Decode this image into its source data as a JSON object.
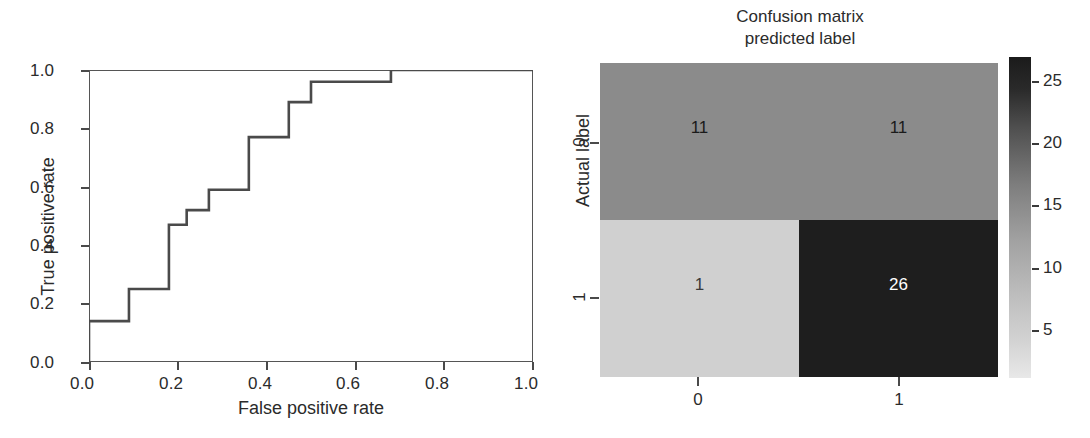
{
  "figure": {
    "background": "#ffffff",
    "width": 1090,
    "height": 438
  },
  "chart_data": [
    {
      "type": "line",
      "name": "roc-curve",
      "title": "",
      "xlabel": "False positive rate",
      "ylabel": "True positive rate",
      "xlim": [
        0.0,
        1.0
      ],
      "ylim": [
        0.0,
        1.0
      ],
      "xticks": [
        "0.0",
        "0.2",
        "0.4",
        "0.6",
        "0.8",
        "1.0"
      ],
      "xtick_values": [
        0.0,
        0.2,
        0.4,
        0.6,
        0.8,
        1.0
      ],
      "yticks": [
        "0.0",
        "0.2",
        "0.4",
        "0.6",
        "0.8",
        "1.0"
      ],
      "ytick_values": [
        0.0,
        0.2,
        0.4,
        0.6,
        0.8,
        1.0
      ],
      "grid": false,
      "legend": "none",
      "line_color": "#4a4a4a",
      "drawstyle": "steps-post",
      "x": [
        0.0,
        0.0,
        0.09,
        0.09,
        0.18,
        0.18,
        0.22,
        0.22,
        0.27,
        0.27,
        0.36,
        0.36,
        0.45,
        0.45,
        0.5,
        0.5,
        0.68,
        0.68,
        1.0
      ],
      "y": [
        0.0,
        0.14,
        0.14,
        0.25,
        0.25,
        0.47,
        0.47,
        0.52,
        0.52,
        0.59,
        0.59,
        0.77,
        0.77,
        0.89,
        0.89,
        0.96,
        0.96,
        1.0,
        1.0
      ]
    },
    {
      "type": "heatmap",
      "name": "confusion-matrix",
      "title_line1": "Confusion matrix",
      "title_line2": "predicted label",
      "xlabel": "",
      "ylabel": "Actual label",
      "xticks": [
        "0",
        "1"
      ],
      "yticks": [
        "0",
        "1"
      ],
      "rows": [
        {
          "label": "0",
          "cells": [
            {
              "value": "11",
              "numeric": 11,
              "fill": "#8b8b8b",
              "text_color": "#1a1a1a"
            },
            {
              "value": "11",
              "numeric": 11,
              "fill": "#8b8b8b",
              "text_color": "#1a1a1a"
            }
          ]
        },
        {
          "label": "1",
          "cells": [
            {
              "value": "1",
              "numeric": 1,
              "fill": "#d0d0d0",
              "text_color": "#3a3a3a"
            },
            {
              "value": "26",
              "numeric": 26,
              "fill": "#1e1e1e",
              "text_color": "#ffffff"
            }
          ]
        }
      ],
      "colorbar": {
        "ticks": [
          "5",
          "10",
          "15",
          "20",
          "25"
        ],
        "tick_values": [
          5,
          10,
          15,
          20,
          25
        ],
        "vmin": 1,
        "vmax": 26,
        "low_color": "#e8e8e8",
        "high_color": "#1b1b1b",
        "orientation": "vertical"
      }
    }
  ],
  "roc": {
    "xlabel": "False positive rate",
    "ylabel": "True positive rate",
    "xticks": [
      "0.0",
      "0.2",
      "0.4",
      "0.6",
      "0.8",
      "1.0"
    ],
    "yticks": [
      "0.0",
      "0.2",
      "0.4",
      "0.6",
      "0.8",
      "1.0"
    ]
  },
  "cm": {
    "title_line1": "Confusion matrix",
    "title_line2": "predicted label",
    "ylabel": "Actual label",
    "xticks": [
      "0",
      "1"
    ],
    "yticks": [
      "0",
      "1"
    ],
    "cells": {
      "r0c0": "11",
      "r0c1": "11",
      "r1c0": "1",
      "r1c1": "26"
    },
    "colorbar_ticks": [
      "5",
      "10",
      "15",
      "20",
      "25"
    ]
  }
}
